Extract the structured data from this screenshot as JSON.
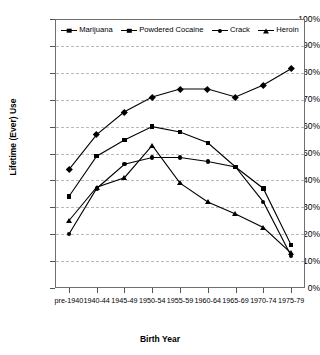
{
  "chart_data": {
    "type": "line",
    "title": "",
    "xlabel": "Birth Year",
    "ylabel": "Lifetime (Ever) Use",
    "categories": [
      "pre-1940",
      "1940-44",
      "1945-49",
      "1950-54",
      "1955-59",
      "1960-64",
      "1965-69",
      "1970-74",
      "1975-79"
    ],
    "ylim": [
      0,
      100
    ],
    "ytick_labels": [
      "0%",
      "10%",
      "20%",
      "30%",
      "40%",
      "50%",
      "60%",
      "70%",
      "80%",
      "90%",
      "100%"
    ],
    "ytick_values": [
      0,
      10,
      20,
      30,
      40,
      50,
      60,
      70,
      80,
      90,
      100
    ],
    "grid": true,
    "legend_position": "top-inside",
    "series": [
      {
        "name": "Marijuana",
        "marker": "diamond",
        "color": "#000000",
        "values": [
          44,
          57,
          65.5,
          71,
          74,
          74,
          71,
          75.5,
          81.5
        ]
      },
      {
        "name": "Powdered Cocaine",
        "marker": "square",
        "color": "#000000",
        "values": [
          34,
          49,
          55,
          60,
          58,
          54,
          45,
          37,
          16
        ]
      },
      {
        "name": "Crack",
        "marker": "circle",
        "color": "#000000",
        "values": [
          20,
          37,
          46,
          48.5,
          48.5,
          47,
          45,
          32,
          12
        ]
      },
      {
        "name": "Heroin",
        "marker": "triangle",
        "color": "#000000",
        "values": [
          25,
          37.5,
          41,
          53,
          39,
          32,
          27.5,
          22.5,
          13
        ]
      }
    ]
  }
}
